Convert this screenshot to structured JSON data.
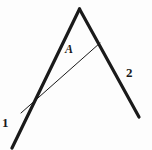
{
  "figure": {
    "background_color": "#fdfdfd",
    "stroke_color": "#1a1a1a",
    "width": 152,
    "height": 150,
    "labels": {
      "ray_left": "1",
      "ray_right": "2",
      "region": "A"
    },
    "strokes": [
      {
        "name": "left-ray",
        "kind": "thick",
        "width": 3.2,
        "x1": 79.5,
        "y1": 9,
        "x2": 12,
        "y2": 148
      },
      {
        "name": "right-ray",
        "kind": "thick",
        "width": 3.2,
        "x1": 79.5,
        "y1": 9,
        "x2": 139,
        "y2": 117
      },
      {
        "name": "interior-segment",
        "kind": "thin",
        "width": 1.0,
        "x1": 21,
        "y1": 113,
        "x2": 100,
        "y2": 43
      }
    ]
  }
}
